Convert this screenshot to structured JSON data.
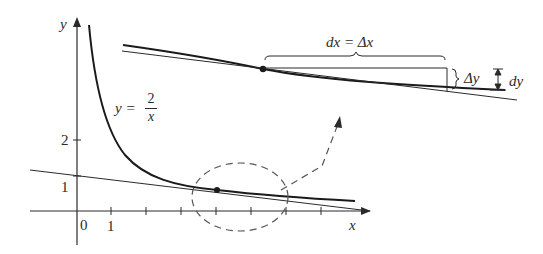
{
  "figure": {
    "type": "differential-approximation-diagram",
    "function_label": {
      "lhs": "y =",
      "numerator": "2",
      "denominator": "x"
    },
    "axes": {
      "x_label": "x",
      "y_label": "y",
      "origin_label": "0",
      "x_tick_label": "1",
      "y_tick_labels": [
        "1",
        "2"
      ]
    },
    "magnified_labels": {
      "dx_eq_deltax": "dx = Δx",
      "delta_y": "Δy",
      "dy": "dy"
    },
    "colors": {
      "ink": "#2a2a2a",
      "background": "#ffffff"
    }
  }
}
